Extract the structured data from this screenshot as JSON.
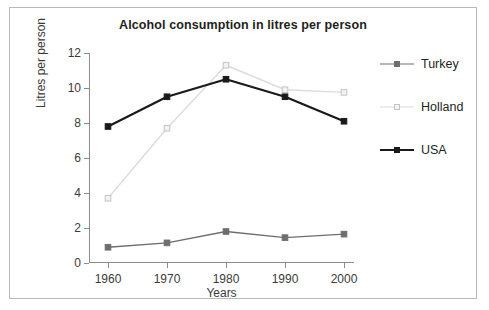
{
  "chart_data": {
    "type": "line",
    "title": "Alcohol consumption in litres per person",
    "xlabel": "Years",
    "ylabel": "Litres per person",
    "categories": [
      "1960",
      "1970",
      "1980",
      "1990",
      "2000"
    ],
    "x": [
      1960,
      1970,
      1980,
      1990,
      2000
    ],
    "ylim": [
      0,
      12
    ],
    "yticks": [
      "0",
      "2",
      "4",
      "6",
      "8",
      "10",
      "12"
    ],
    "ytick_values": [
      0,
      2,
      4,
      6,
      8,
      10,
      12
    ],
    "grid": false,
    "legend_position": "right",
    "series": [
      {
        "name": "Turkey",
        "values": [
          0.9,
          1.15,
          1.8,
          1.45,
          1.65
        ],
        "color": "#6e6e6e",
        "marker": "filled-square",
        "marker_fill": "#6e6e6e",
        "line_width": 1.4
      },
      {
        "name": "Holland",
        "values": [
          3.7,
          7.7,
          11.3,
          9.9,
          9.75
        ],
        "color": "#dcdcdc",
        "marker": "open-square",
        "marker_fill": "#f2f2f2",
        "line_width": 1.4
      },
      {
        "name": "USA",
        "values": [
          7.8,
          9.5,
          10.5,
          9.5,
          8.1
        ],
        "color": "#1a1a1a",
        "marker": "filled-square",
        "marker_fill": "#1a1a1a",
        "line_width": 2.2
      }
    ]
  },
  "figure": {
    "border_color": "#b9b9b9",
    "background": "#ffffff",
    "axis_color": "#8c8c8c",
    "text_color": "#231f20"
  }
}
